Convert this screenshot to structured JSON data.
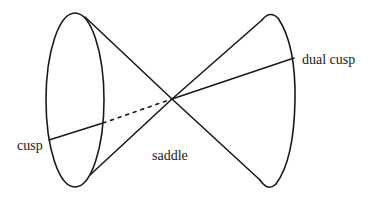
{
  "diagram": {
    "labels": {
      "cusp": "cusp",
      "saddle": "saddle",
      "dual_cusp": "dual cusp"
    },
    "colors": {
      "line": "#1a1a1a",
      "background": "#ffffff"
    }
  }
}
